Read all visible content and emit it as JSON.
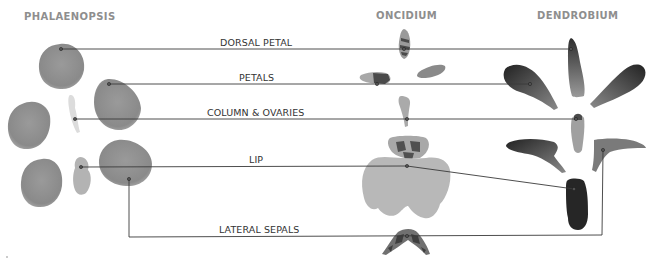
{
  "headings": {
    "phalaenopsis": "PHALAENOPSIS",
    "oncidium": "ONCIDIUM",
    "dendrobium": "DENDROBIUM"
  },
  "labels": {
    "dorsal_petal": "DORSAL PETAL",
    "petals": "PETALS",
    "column_ovaries": "COLUMN & OVARIES",
    "lip": "LIP",
    "lateral_sepals": "LATERAL SEPALS"
  },
  "colors": {
    "phalaenopsis_part": "#8f8f8f",
    "oncidium_part": "#b5b5b5",
    "oncidium_marking": "#4a4a4a",
    "dendrobium_part": "#3c3c3c",
    "leader_line": "#3a3a3a",
    "heading": "#8e8e8e"
  }
}
